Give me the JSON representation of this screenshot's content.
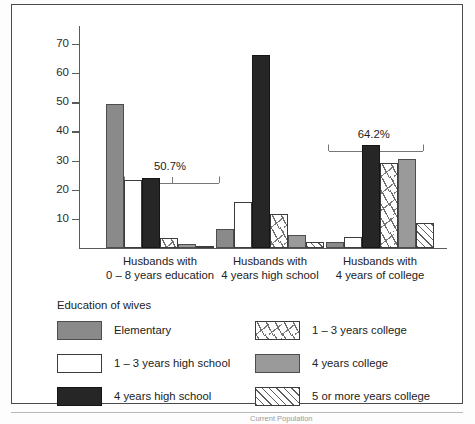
{
  "figure": {
    "page_caption": "Current Population"
  },
  "chart_data": {
    "type": "bar",
    "title": "",
    "xlabel": "",
    "ylabel": "Percentage of males",
    "ylim": [
      0,
      75
    ],
    "yticks": [
      10,
      20,
      30,
      40,
      50,
      60,
      70
    ],
    "grid": false,
    "legend_position": "below-plot",
    "legend_title": "Education of wives",
    "categories": [
      "Husbands with\n0 – 8 years education",
      "Husbands with\n4 years high school",
      "Husbands with\n4 years of college"
    ],
    "category_lines": [
      [
        "Husbands with",
        "0 – 8 years education"
      ],
      [
        "Husbands with",
        "4 years high school"
      ],
      [
        "Husbands with",
        "4 years of college"
      ]
    ],
    "series": [
      {
        "name": "Elementary",
        "fill": "solid-gray",
        "color": "#8a8a8a",
        "values": [
          49.5,
          6.3,
          1.8
        ]
      },
      {
        "name": "1 – 3 years high school",
        "fill": "white",
        "color": "#ffffff",
        "values": [
          23.3,
          15.6,
          3.8
        ]
      },
      {
        "name": "4 years high school",
        "fill": "solid-black",
        "color": "#262626",
        "values": [
          24.0,
          66.2,
          35.2
        ]
      },
      {
        "name": "1 – 3 years college",
        "fill": "sparse-dashes",
        "color": "#ffffff",
        "values": [
          3.5,
          11.5,
          29.0
        ]
      },
      {
        "name": "4 years college",
        "fill": "solid-gray",
        "color": "#9a9a9a",
        "values": [
          1.2,
          4.3,
          30.6
        ]
      },
      {
        "name": "5 or more years college",
        "fill": "diagonal-hatch",
        "color": "#ffffff",
        "values": [
          0.5,
          1.8,
          8.5
        ]
      }
    ],
    "annotations": [
      {
        "label": "50.7%",
        "group": 0
      },
      {
        "label": "64.2%",
        "group": 2
      }
    ]
  }
}
